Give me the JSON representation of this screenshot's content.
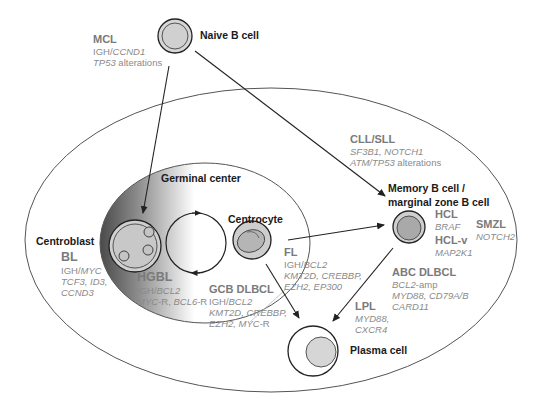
{
  "cells": {
    "naive": "Naive B cell",
    "germinal_center": "Germinal center",
    "centroblast": "Centroblast",
    "centrocyte": "Centrocyte",
    "memory_line1": "Memory B cell /",
    "memory_line2": "marginal zone B cell",
    "plasma": "Plasma cell"
  },
  "diseases": {
    "mcl": {
      "name": "MCL",
      "line1_a": "IGH/",
      "line1_b": "CCND1",
      "line2_a": "TP53",
      "line2_b": " alterations"
    },
    "cll": {
      "name": "CLL/SLL",
      "line1": "SF3B1, NOTCH1",
      "line2_a": "ATM/TP53",
      "line2_b": " alterations"
    },
    "bl": {
      "name": "BL",
      "line1_a": "IGH/",
      "line1_b": "MYC",
      "line2": "TCF3, ID3,",
      "line3": "CCND3"
    },
    "hgbl": {
      "name": "HGBL",
      "line1_a": "IGH/",
      "line1_b": "BCL2",
      "line2_a": "MYC",
      "line2_b": "-R, ",
      "line2_c": "BCL6",
      "line2_d": "-R"
    },
    "gcb": {
      "name": "GCB DLBCL",
      "line1_a": "IGH/",
      "line1_b": "BCL2",
      "line2": "KMT2D, CREBBP,",
      "line3_a": "EZH2, MYC",
      "line3_b": "-R"
    },
    "fl": {
      "name": "FL",
      "line1_a": "IGH/",
      "line1_b": "BCL2",
      "line2": "KMT2D, CREBBP,",
      "line3": "EZH2, EP300"
    },
    "hcl": {
      "name": "HCL",
      "line1": "BRAF"
    },
    "hclv": {
      "name": "HCL-v",
      "line1": "MAP2K1"
    },
    "smzl": {
      "name": "SMZL",
      "line1": "NOTCH2"
    },
    "abc": {
      "name": "ABC DLBCL",
      "line1_a": "BCL2",
      "line1_b": "-amp",
      "line2": "MYD88, CD79A/B",
      "line3": "CARD11"
    },
    "lpl": {
      "name": "LPL",
      "line1": "MYD88,",
      "line2": "CXCR4"
    }
  },
  "colors": {
    "cell_fill": "#d2d2d2",
    "cell_inner": "#bdbdbd",
    "line": "#222222",
    "ellipse": "#555555",
    "gc_dark": "#5a5a5a",
    "disease_text": "#7a7a7a",
    "gene_text": "#8a8a8a"
  }
}
